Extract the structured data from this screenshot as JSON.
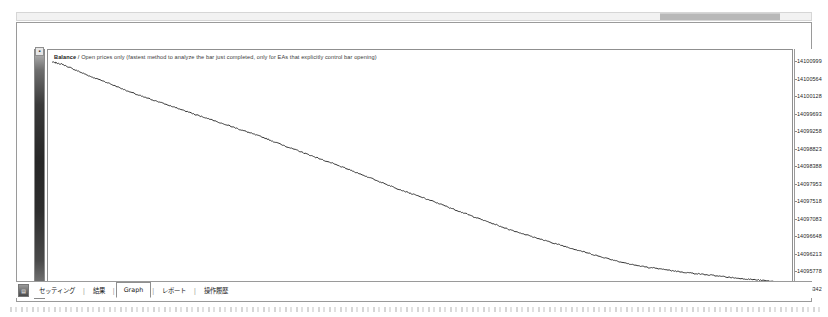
{
  "window": {
    "tester_icon": "tester-icon",
    "scroll_icon": "horizontal-scrollbar"
  },
  "chart": {
    "title_main": "Balance",
    "title_sep": " / ",
    "title_rest": "Open prices only (fastest method to analyze the bar just completed, only for EAs that explicitly control bar opening)"
  },
  "tabs": [
    {
      "label": "セッティング",
      "active": false
    },
    {
      "label": "結果",
      "active": false
    },
    {
      "label": "Graph",
      "active": true
    },
    {
      "label": "レポート",
      "active": false
    },
    {
      "label": "操作履歴",
      "active": false
    }
  ],
  "colors": {
    "line": "#333333",
    "axis": "#8f8f8f",
    "text": "#1d1d1d",
    "panel_border": "#9a9a9a",
    "rail_dark": "#272727"
  },
  "chart_data": {
    "type": "line",
    "title": "Balance / Open prices only (fastest method to analyze the bar just completed, only for EAs that explicitly control bar opening)",
    "xlabel": "",
    "ylabel": "",
    "grid": false,
    "legend": "none",
    "xlim": [
      0,
      21630
    ],
    "ylim": [
      14095342,
      14100999
    ],
    "xticks": [
      0,
      578,
      1091,
      1605,
      2118,
      2632,
      3146,
      3658,
      4172,
      4685,
      5199,
      5712,
      6226,
      6739,
      7253,
      7766,
      8280,
      8793,
      9307,
      9820,
      10334,
      10847,
      11361,
      11874,
      12387,
      12901,
      13414,
      13928,
      14441,
      14955,
      15468,
      15982,
      16495,
      17009,
      17522,
      18036,
      18549,
      19063,
      19576,
      20090,
      20603,
      21116,
      21630
    ],
    "yticks": [
      14100999,
      14100564,
      14100128,
      14099693,
      14099258,
      14098823,
      14098388,
      14097953,
      14097518,
      14097083,
      14096648,
      14096213,
      14095778,
      14095342
    ],
    "series": [
      {
        "name": "Balance",
        "x": [
          0,
          300,
          700,
          1100,
          1600,
          2100,
          2600,
          3100,
          3600,
          4200,
          4700,
          5200,
          5700,
          6200,
          6700,
          7250,
          7750,
          8280,
          8800,
          9300,
          9820,
          10330,
          10850,
          11360,
          11870,
          12390,
          12900,
          13410,
          13930,
          14440,
          14950,
          15470,
          15980,
          16500,
          17000,
          17520,
          18040,
          18550,
          19060,
          19580,
          20090,
          20600,
          21120,
          21630
        ],
        "values": [
          14100999,
          14100940,
          14100790,
          14100640,
          14100480,
          14100300,
          14100130,
          14099990,
          14099840,
          14099660,
          14099520,
          14099370,
          14099220,
          14099070,
          14098900,
          14098720,
          14098560,
          14098390,
          14098220,
          14098050,
          14097870,
          14097700,
          14097540,
          14097380,
          14097210,
          14097040,
          14096880,
          14096720,
          14096580,
          14096440,
          14096310,
          14096180,
          14096050,
          14095930,
          14095820,
          14095740,
          14095680,
          14095620,
          14095570,
          14095520,
          14095470,
          14095430,
          14095390,
          14095342
        ]
      }
    ]
  }
}
